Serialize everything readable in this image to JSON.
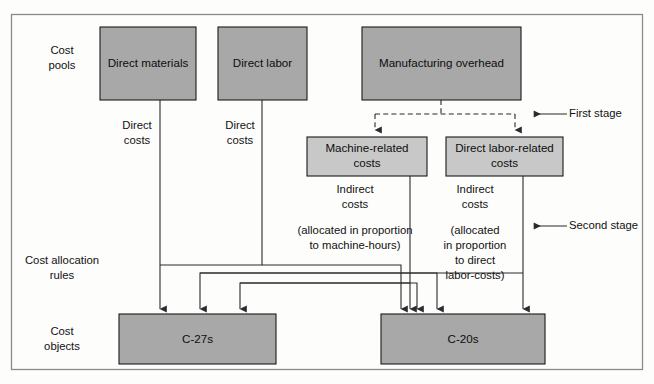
{
  "diagram": {
    "colors": {
      "box_fill": "#a8a8a8",
      "box_fill_light": "#c8c8c8",
      "line": "#2b2b2b",
      "frame": "#8a8a8a",
      "background": "#fdfdfc"
    },
    "row_labels": [
      {
        "id": "cost-pools",
        "line1": "Cost",
        "line2": "pools"
      },
      {
        "id": "cost-allocation-rules",
        "line1": "Cost allocation",
        "line2": "rules"
      },
      {
        "id": "cost-objects",
        "line1": "Cost",
        "line2": "objects"
      }
    ],
    "cost_pools": [
      {
        "id": "direct-materials",
        "label": "Direct materials"
      },
      {
        "id": "direct-labor",
        "label": "Direct labor"
      },
      {
        "id": "manufacturing-overhead",
        "label": "Manufacturing overhead"
      }
    ],
    "overhead_pools": [
      {
        "id": "machine-related-costs",
        "line1": "Machine-related",
        "line2": "costs"
      },
      {
        "id": "direct-labor-related-costs",
        "line1": "Direct labor-related",
        "line2": "costs"
      }
    ],
    "cost_objects": [
      {
        "id": "c-27s",
        "label": "C-27s"
      },
      {
        "id": "c-20s",
        "label": "C-20s"
      }
    ],
    "flow_labels": [
      {
        "id": "direct-costs-materials",
        "line1": "Direct",
        "line2": "costs"
      },
      {
        "id": "direct-costs-labor",
        "line1": "Direct",
        "line2": "costs"
      },
      {
        "id": "indirect-costs-machine",
        "line1": "Indirect",
        "line2": "costs"
      },
      {
        "id": "indirect-costs-labor",
        "line1": "Indirect",
        "line2": "costs"
      }
    ],
    "allocation_notes": [
      {
        "id": "machine-hours-note",
        "line1": "(allocated in proportion",
        "line2": "to machine-hours)"
      },
      {
        "id": "direct-labor-costs-note",
        "line1": "(allocated",
        "line2": "in proportion",
        "line3": "to direct",
        "line4": "labor-costs)"
      }
    ],
    "stage_markers": [
      {
        "id": "first-stage",
        "label": "First stage"
      },
      {
        "id": "second-stage",
        "label": "Second stage"
      }
    ]
  }
}
